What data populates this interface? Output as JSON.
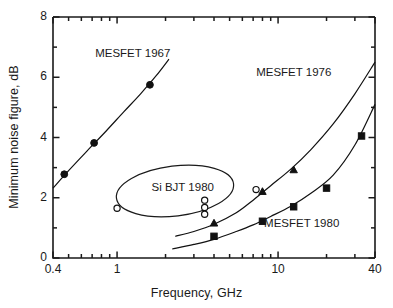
{
  "chart_data": {
    "type": "scatter",
    "title": "",
    "xlabel": "Frequency, GHz",
    "ylabel": "Minimum noise figure, dB",
    "xscale": "log",
    "yscale": "linear",
    "xlim": [
      0.4,
      40
    ],
    "ylim": [
      0,
      8
    ],
    "grid": false,
    "legend": "none (inline curve labels)",
    "xticks": [
      {
        "value": 0.4,
        "label": "0.4"
      },
      {
        "value": 0.5,
        "label": ""
      },
      {
        "value": 0.6,
        "label": ""
      },
      {
        "value": 0.7,
        "label": ""
      },
      {
        "value": 0.8,
        "label": ""
      },
      {
        "value": 0.9,
        "label": ""
      },
      {
        "value": 1,
        "label": "1"
      },
      {
        "value": 2,
        "label": ""
      },
      {
        "value": 3,
        "label": ""
      },
      {
        "value": 4,
        "label": ""
      },
      {
        "value": 5,
        "label": ""
      },
      {
        "value": 6,
        "label": ""
      },
      {
        "value": 7,
        "label": ""
      },
      {
        "value": 8,
        "label": ""
      },
      {
        "value": 9,
        "label": ""
      },
      {
        "value": 10,
        "label": "10"
      },
      {
        "value": 20,
        "label": ""
      },
      {
        "value": 30,
        "label": ""
      },
      {
        "value": 40,
        "label": "40"
      }
    ],
    "yticks": [
      {
        "value": 0,
        "label": "0"
      },
      {
        "value": 1,
        "label": ""
      },
      {
        "value": 2,
        "label": "2"
      },
      {
        "value": 3,
        "label": ""
      },
      {
        "value": 4,
        "label": "4"
      },
      {
        "value": 5,
        "label": ""
      },
      {
        "value": 6,
        "label": "6"
      },
      {
        "value": 7,
        "label": ""
      },
      {
        "value": 8,
        "label": "8"
      }
    ],
    "series": [
      {
        "name": "MESFET 1967",
        "marker": "filled-circle",
        "color": "#111111",
        "label_text": "MESFET 1967",
        "label_x": 1.25,
        "label_y": 6.75,
        "points": [
          {
            "x": 0.47,
            "y": 2.78
          },
          {
            "x": 0.72,
            "y": 3.82
          },
          {
            "x": 1.6,
            "y": 5.75
          }
        ],
        "curve": [
          {
            "x": 0.4,
            "y": 2.32
          },
          {
            "x": 0.5,
            "y": 2.9
          },
          {
            "x": 0.65,
            "y": 3.55
          },
          {
            "x": 0.85,
            "y": 4.2
          },
          {
            "x": 1.1,
            "y": 4.85
          },
          {
            "x": 1.4,
            "y": 5.45
          },
          {
            "x": 1.75,
            "y": 6.05
          },
          {
            "x": 2.1,
            "y": 6.6
          }
        ]
      },
      {
        "name": "MESFET 1976",
        "marker": "filled-triangle",
        "color": "#111111",
        "label_text": "MESFET 1976",
        "label_x": 12.5,
        "label_y": 6.1,
        "points": [
          {
            "x": 4.0,
            "y": 1.15
          },
          {
            "x": 8.0,
            "y": 2.2
          },
          {
            "x": 12.5,
            "y": 2.92
          }
        ],
        "curve": [
          {
            "x": 2.3,
            "y": 0.72
          },
          {
            "x": 3.0,
            "y": 0.88
          },
          {
            "x": 4.0,
            "y": 1.12
          },
          {
            "x": 5.5,
            "y": 1.5
          },
          {
            "x": 7.0,
            "y": 1.92
          },
          {
            "x": 9.0,
            "y": 2.4
          },
          {
            "x": 12.0,
            "y": 2.95
          },
          {
            "x": 16.0,
            "y": 3.6
          },
          {
            "x": 22.0,
            "y": 4.45
          },
          {
            "x": 30.0,
            "y": 5.45
          },
          {
            "x": 40.0,
            "y": 6.5
          }
        ]
      },
      {
        "name": "MESFET 1980",
        "marker": "filled-square",
        "color": "#111111",
        "label_text": "MESFET 1980",
        "label_x": 14.0,
        "label_y": 1.1,
        "points": [
          {
            "x": 4.0,
            "y": 0.72
          },
          {
            "x": 8.0,
            "y": 1.22
          },
          {
            "x": 12.5,
            "y": 1.7
          },
          {
            "x": 20.0,
            "y": 2.32
          },
          {
            "x": 33.0,
            "y": 4.05
          }
        ],
        "curve": [
          {
            "x": 2.2,
            "y": 0.3
          },
          {
            "x": 3.0,
            "y": 0.45
          },
          {
            "x": 4.0,
            "y": 0.62
          },
          {
            "x": 5.5,
            "y": 0.88
          },
          {
            "x": 7.0,
            "y": 1.1
          },
          {
            "x": 9.0,
            "y": 1.38
          },
          {
            "x": 12.0,
            "y": 1.72
          },
          {
            "x": 16.0,
            "y": 2.15
          },
          {
            "x": 22.0,
            "y": 2.75
          },
          {
            "x": 30.0,
            "y": 3.75
          },
          {
            "x": 40.0,
            "y": 5.1
          }
        ]
      },
      {
        "name": "Si BJT 1980",
        "marker": "open-circle",
        "color": "#111111",
        "label_text": "Si BJT 1980",
        "label_x": 2.55,
        "label_y": 2.28,
        "points": [
          {
            "x": 1.0,
            "y": 1.65
          },
          {
            "x": 3.5,
            "y": 1.92
          },
          {
            "x": 3.5,
            "y": 1.68
          },
          {
            "x": 3.5,
            "y": 1.45
          },
          {
            "x": 7.3,
            "y": 2.27
          }
        ],
        "enclosure": {
          "shape": "ellipse",
          "cx_px": 175,
          "cy_px": 191,
          "rx_px": 59,
          "ry_px": 25,
          "rotation_deg": -7
        }
      }
    ],
    "annotations": [
      {
        "text": "MESFET 1967",
        "x": 1.25,
        "y": 6.75
      },
      {
        "text": "MESFET 1976",
        "x": 12.5,
        "y": 6.1
      },
      {
        "text": "MESFET 1980",
        "x": 14.0,
        "y": 1.1
      },
      {
        "text": "Si BJT 1980",
        "x": 2.55,
        "y": 2.28
      }
    ]
  },
  "axes": {
    "x_title": "Frequency, GHz",
    "y_title": "Minimum noise figure, dB",
    "x_tick_labels": [
      "0.4",
      "1",
      "10",
      "40"
    ],
    "y_tick_labels": [
      "0",
      "2",
      "4",
      "6",
      "8"
    ]
  },
  "style": {
    "line_color": "#1a1a1a",
    "marker_color": "#111111",
    "background": "#ffffff"
  }
}
